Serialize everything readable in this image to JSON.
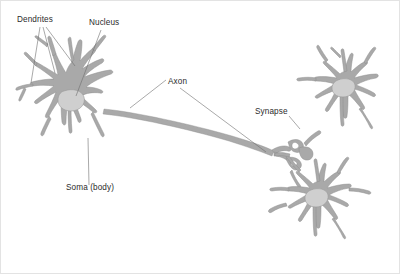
{
  "figure": {
    "background_color": "#ffffff",
    "frame_color": "#e3e3e3",
    "width": 400,
    "height": 274
  },
  "colors": {
    "cell_fill": "#a9a9a9",
    "cell_stroke": "#8f8f8f",
    "nucleus_fill": "#cfcfcf",
    "nucleus_stroke": "#9a9a9a",
    "leader_line": "#6e6e6e",
    "label_text": "#2b2b2b"
  },
  "labels": [
    {
      "id": "dendrites",
      "text": "Dendrites",
      "x": 17,
      "y": 22,
      "anchor": "start",
      "leaders": 3
    },
    {
      "id": "nucleus",
      "text": "Nucleus",
      "x": 89,
      "y": 25,
      "anchor": "start",
      "leaders": 1
    },
    {
      "id": "axon",
      "text": "Axon",
      "x": 168,
      "y": 84,
      "anchor": "start",
      "leaders": 2
    },
    {
      "id": "synapse",
      "text": "Synapse",
      "x": 255,
      "y": 114,
      "anchor": "start",
      "leaders": 1
    },
    {
      "id": "soma",
      "text": "Soma (body)",
      "x": 66,
      "y": 190,
      "anchor": "start",
      "leaders": 1
    }
  ],
  "structures": [
    {
      "id": "main-neuron",
      "name": "Main neuron cell body with dendrites",
      "has_nucleus": true
    },
    {
      "id": "axon",
      "name": "Axon shaft",
      "has_nucleus": false
    },
    {
      "id": "axon-terminal",
      "name": "Axon terminal branches",
      "has_nucleus": false
    },
    {
      "id": "neuron-top-right",
      "name": "Target neuron upper right",
      "has_nucleus": true
    },
    {
      "id": "neuron-bottom-right",
      "name": "Target neuron lower right",
      "has_nucleus": true
    }
  ]
}
